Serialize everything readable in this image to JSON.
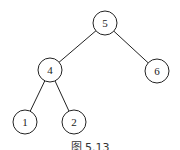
{
  "diagram": {
    "type": "binary-tree",
    "nodes": [
      {
        "id": "n5",
        "label": "5",
        "cx": 105,
        "cy": 23
      },
      {
        "id": "n4",
        "label": "4",
        "cx": 50,
        "cy": 70
      },
      {
        "id": "n6",
        "label": "6",
        "cx": 157,
        "cy": 71
      },
      {
        "id": "n1",
        "label": "1",
        "cx": 25,
        "cy": 122
      },
      {
        "id": "n2",
        "label": "2",
        "cx": 74,
        "cy": 122
      }
    ],
    "edges": [
      {
        "from": "n5",
        "to": "n4"
      },
      {
        "from": "n5",
        "to": "n6"
      },
      {
        "from": "n4",
        "to": "n1"
      },
      {
        "from": "n4",
        "to": "n2"
      }
    ],
    "radius": 12,
    "caption": "图 5.13"
  }
}
